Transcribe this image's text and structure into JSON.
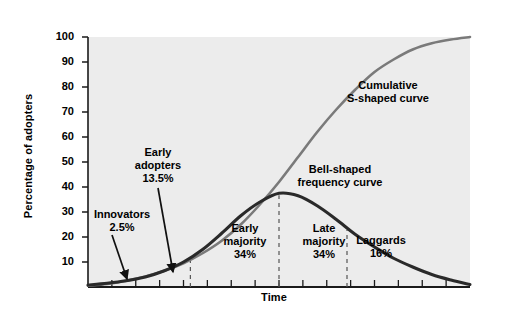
{
  "chart_data": {
    "type": "line",
    "title": "",
    "xlabel": "Time",
    "ylabel": "Percentage of adopters",
    "ylim": [
      0,
      100
    ],
    "ytick_labels": [
      "100",
      "90",
      "80",
      "70",
      "60",
      "50",
      "40",
      "30",
      "20",
      "10"
    ],
    "ytick_values": [
      100,
      90,
      80,
      70,
      60,
      50,
      40,
      30,
      20,
      10
    ],
    "grid": false,
    "legend_position": "inline-annotations",
    "series": [
      {
        "name": "Cumulative S-shaped curve",
        "color": "#7a7a7a",
        "x": [
          0,
          5,
          10,
          15,
          20,
          25,
          30,
          35,
          40,
          45,
          50,
          55,
          60,
          65,
          70,
          75,
          80,
          85,
          90,
          95,
          100
        ],
        "values": [
          0.5,
          1.2,
          2.5,
          4.2,
          6.5,
          9.5,
          13.5,
          18.5,
          25,
          33,
          42,
          52,
          62,
          71,
          79,
          86,
          91,
          95,
          97.5,
          99,
          100
        ]
      },
      {
        "name": "Bell-shaped frequency curve",
        "color": "#2a2a2a",
        "x": [
          0,
          5,
          10,
          15,
          20,
          25,
          30,
          35,
          40,
          45,
          50,
          55,
          60,
          65,
          70,
          75,
          80,
          85,
          90,
          95,
          100
        ],
        "values": [
          0.8,
          1.5,
          2.5,
          4,
          6.5,
          10,
          15,
          21.5,
          28.5,
          34,
          37.5,
          36.5,
          32.5,
          27,
          21,
          16,
          11.5,
          8,
          5,
          2.8,
          1
        ]
      }
    ],
    "dividers": [
      {
        "label": "innovators-early-adopters",
        "x_pct": 26.8
      },
      {
        "label": "early-majority-late-majority",
        "x_pct": 50.0
      },
      {
        "label": "late-majority-laggards",
        "x_pct": 67.8
      }
    ]
  },
  "annotations": {
    "curve_cumulative": "Cumulative\nS-shaped curve",
    "curve_bell": "Bell-shaped\nfrequency curve",
    "innovators": "Innovators\n2.5%",
    "early_adopters": "Early\nadopters\n13.5%",
    "early_majority": "Early\nmajority\n34%",
    "late_majority": "Late\nmajority\n34%",
    "laggards": "Laggards\n16%"
  },
  "colors": {
    "plot_background": "#ececec",
    "axis": "#1a1a1a",
    "cumulative_curve": "#7a7a7a",
    "bell_curve": "#2a2a2a",
    "divider": "#555555"
  }
}
